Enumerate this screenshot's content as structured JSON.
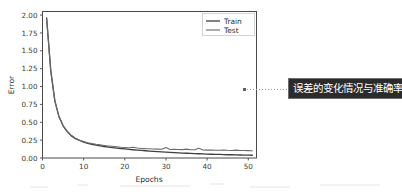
{
  "figure": {
    "background_color": "#ffffff",
    "axes_edge_color": "#4a4a4a",
    "text_color": "#2e2e2e"
  },
  "annotation": {
    "name": "error-and-accuracy-callout",
    "text": "误差的变化情况与准确率",
    "background_color": "#2b2b2b",
    "text_color": "#ffffff",
    "border_color": "#6e6e6e",
    "leader_line_color": "#9a9a9a",
    "leader_marker_color": "#5e5e5e"
  },
  "chart_data": {
    "type": "line",
    "title": "",
    "xlabel": "Epochs",
    "ylabel": "Error",
    "xlim": [
      0,
      52
    ],
    "ylim": [
      0.0,
      2.05
    ],
    "xticks": [
      0,
      10,
      20,
      30,
      40,
      50
    ],
    "xtick_labels": [
      "0",
      "10",
      "20",
      "30",
      "40",
      "50"
    ],
    "yticks": [
      0.0,
      0.25,
      0.5,
      0.75,
      1.0,
      1.25,
      1.5,
      1.75,
      2.0
    ],
    "ytick_labels": [
      "0.00",
      "0.25",
      "0.50",
      "0.75",
      "1.00",
      "1.25",
      "1.50",
      "1.75",
      "2.00"
    ],
    "grid": false,
    "legend_position": "upper right",
    "legend_entries": [
      "Train",
      "Test"
    ],
    "x": [
      1,
      2,
      3,
      4,
      5,
      6,
      7,
      8,
      9,
      10,
      11,
      12,
      13,
      14,
      15,
      16,
      17,
      18,
      19,
      20,
      21,
      22,
      23,
      24,
      25,
      26,
      27,
      28,
      29,
      30,
      31,
      32,
      33,
      34,
      35,
      36,
      37,
      38,
      39,
      40,
      41,
      42,
      43,
      44,
      45,
      46,
      47,
      48,
      49,
      50,
      51
    ],
    "series": [
      {
        "name": "Train",
        "color": "#3f3f3f",
        "values": [
          1.96,
          1.23,
          0.8,
          0.58,
          0.45,
          0.37,
          0.31,
          0.27,
          0.245,
          0.222,
          0.205,
          0.192,
          0.18,
          0.17,
          0.161,
          0.153,
          0.146,
          0.139,
          0.133,
          0.127,
          0.121,
          0.116,
          0.111,
          0.106,
          0.101,
          0.097,
          0.093,
          0.089,
          0.085,
          0.082,
          0.078,
          0.075,
          0.072,
          0.069,
          0.066,
          0.064,
          0.061,
          0.059,
          0.057,
          0.055,
          0.053,
          0.051,
          0.05,
          0.048,
          0.046,
          0.045,
          0.044,
          0.042,
          0.041,
          0.04,
          0.039
        ]
      },
      {
        "name": "Test",
        "color": "#6b6b6b",
        "values": [
          1.95,
          1.22,
          0.8,
          0.58,
          0.455,
          0.375,
          0.318,
          0.278,
          0.25,
          0.23,
          0.214,
          0.202,
          0.192,
          0.184,
          0.176,
          0.169,
          0.163,
          0.157,
          0.151,
          0.147,
          0.142,
          0.15,
          0.139,
          0.134,
          0.131,
          0.13,
          0.127,
          0.124,
          0.122,
          0.148,
          0.12,
          0.121,
          0.118,
          0.117,
          0.124,
          0.116,
          0.114,
          0.135,
          0.112,
          0.11,
          0.112,
          0.109,
          0.108,
          0.113,
          0.107,
          0.106,
          0.11,
          0.105,
          0.104,
          0.103,
          0.102
        ]
      }
    ]
  }
}
